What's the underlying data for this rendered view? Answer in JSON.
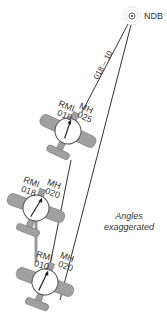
{
  "station": {
    "label": "NDB"
  },
  "course_label": "018 – 10",
  "caption": {
    "line1": "Angles",
    "line2": "exaggerated"
  },
  "aircraft": [
    {
      "rmi_label": "RMI",
      "rmi_value": "018",
      "mh_label": "MH",
      "mh_value": "025"
    },
    {
      "rmi_label": "RMI",
      "rmi_value": "018",
      "mh_label": "MH",
      "mh_value": "020"
    },
    {
      "rmi_label": "RMI",
      "rmi_value": "010",
      "mh_label": "MH",
      "mh_value": "020"
    }
  ],
  "colors": {
    "line": "#333333",
    "aircraft": "#a0a0a0",
    "dial": "#ffffff"
  }
}
